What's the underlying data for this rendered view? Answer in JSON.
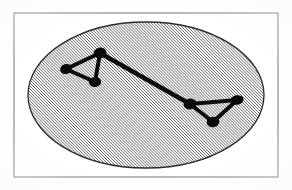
{
  "figure": {
    "canvas": {
      "width": 292,
      "height": 190,
      "background": "#ffffff"
    },
    "border": {
      "label": "figure frame",
      "x": 14,
      "y": 13,
      "width": 264,
      "height": 164,
      "stroke": "#8a8a8a",
      "stroke_width": 1.2,
      "fill": "none"
    },
    "region": {
      "label": "hatched elliptical region",
      "shape": "ellipse",
      "cx": 146,
      "cy": 95,
      "rx": 118,
      "ry": 73,
      "fill_pattern": "diagonal-hatch",
      "hatch_angle_deg": 45,
      "hatch_spacing_px": 2.1,
      "hatch_stroke": "#3a3a3a",
      "hatch_stroke_width": 1.05,
      "hatch_background": "#fbfbfb",
      "outline_stroke": "#2b2b2b",
      "outline_stroke_width": 1.3
    },
    "graph": {
      "label": "node-link overlay",
      "node_fill": "#0b0b0b",
      "edge_stroke": "#0b0b0b",
      "edge_stroke_width": 4.2,
      "nodes": [
        {
          "id": "L1",
          "label": "left-cluster-west-node",
          "x": 66,
          "y": 69,
          "rx": 6.0,
          "ry": 5.0,
          "rotate": -18
        },
        {
          "id": "L2",
          "label": "left-cluster-apex-node",
          "x": 100,
          "y": 53,
          "rx": 6.5,
          "ry": 5.4,
          "rotate": -12
        },
        {
          "id": "L3",
          "label": "left-cluster-south-node",
          "x": 95,
          "y": 82,
          "rx": 6.2,
          "ry": 5.0,
          "rotate": -8
        },
        {
          "id": "R1",
          "label": "right-cluster-west-node",
          "x": 190,
          "y": 104,
          "rx": 6.4,
          "ry": 5.4,
          "rotate": -14
        },
        {
          "id": "R2",
          "label": "right-cluster-east-node",
          "x": 237,
          "y": 100,
          "rx": 6.6,
          "ry": 4.8,
          "rotate": -10
        },
        {
          "id": "R3",
          "label": "right-cluster-south-node",
          "x": 213,
          "y": 122,
          "rx": 6.4,
          "ry": 5.2,
          "rotate": -6
        }
      ],
      "edges": [
        {
          "id": "E1",
          "label": "left-west-to-apex",
          "from": "L1",
          "to": "L2",
          "width": 4.0
        },
        {
          "id": "E2",
          "label": "left-west-to-south",
          "from": "L1",
          "to": "L3",
          "width": 3.8
        },
        {
          "id": "E3",
          "label": "left-apex-to-south",
          "from": "L2",
          "to": "L3",
          "width": 4.0
        },
        {
          "id": "E4",
          "label": "bridge-left-apex-to-right-west",
          "from": "L2",
          "to": "R1",
          "width": 4.4
        },
        {
          "id": "E5",
          "label": "right-west-to-east",
          "from": "R1",
          "to": "R2",
          "width": 4.2
        },
        {
          "id": "E6",
          "label": "right-west-to-south",
          "from": "R1",
          "to": "R3",
          "width": 3.8
        },
        {
          "id": "E7",
          "label": "right-east-to-south",
          "from": "R2",
          "to": "R3",
          "width": 4.0
        }
      ]
    }
  }
}
